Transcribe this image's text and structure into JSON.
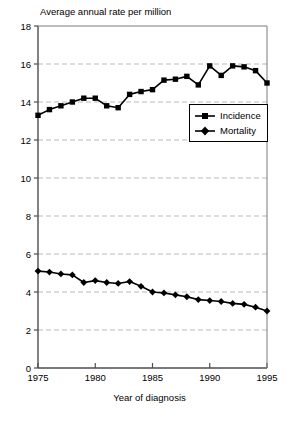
{
  "chart_data": {
    "type": "line",
    "title": "Average annual rate per million",
    "xlabel": "Year of diagnosis",
    "ylabel": "",
    "xlim": [
      1975,
      1995
    ],
    "ylim": [
      0,
      18
    ],
    "xticks": [
      1975,
      1980,
      1985,
      1990,
      1995
    ],
    "yticks": [
      0,
      2,
      4,
      6,
      8,
      10,
      12,
      14,
      16,
      18
    ],
    "grid": "horizontal-dashed",
    "legend_position": "inside-right-upper",
    "x": [
      1975,
      1976,
      1977,
      1978,
      1979,
      1980,
      1981,
      1982,
      1983,
      1984,
      1985,
      1986,
      1987,
      1988,
      1989,
      1990,
      1991,
      1992,
      1993,
      1994,
      1995
    ],
    "series": [
      {
        "name": "Incidence",
        "marker": "square",
        "values": [
          13.3,
          13.6,
          13.8,
          14.0,
          14.2,
          14.2,
          13.8,
          13.7,
          14.4,
          14.55,
          14.65,
          15.15,
          15.2,
          15.35,
          14.9,
          15.9,
          15.4,
          15.9,
          15.85,
          15.65,
          15.0
        ]
      },
      {
        "name": "Mortality",
        "marker": "diamond",
        "values": [
          5.1,
          5.05,
          4.95,
          4.9,
          4.5,
          4.6,
          4.5,
          4.45,
          4.55,
          4.3,
          4.0,
          3.95,
          3.85,
          3.75,
          3.6,
          3.55,
          3.5,
          3.4,
          3.35,
          3.2,
          3.0
        ]
      }
    ]
  },
  "axis": {
    "x_tick_labels": [
      "1975",
      "1980",
      "1985",
      "1990",
      "1995"
    ],
    "y_tick_labels": [
      "0",
      "2",
      "4",
      "6",
      "8",
      "10",
      "12",
      "14",
      "16",
      "18"
    ]
  },
  "legend": {
    "items": [
      {
        "label": "Incidence",
        "marker": "square"
      },
      {
        "label": "Mortality",
        "marker": "diamond"
      }
    ]
  }
}
